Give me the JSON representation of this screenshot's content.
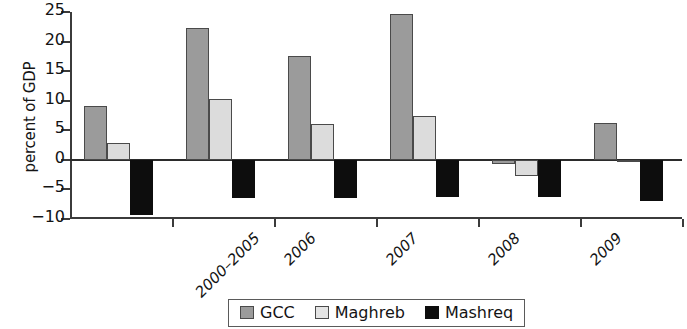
{
  "chart_data": {
    "type": "bar",
    "title": "",
    "xlabel": "",
    "ylabel": "percent of GDP",
    "ylim": [
      -10,
      25
    ],
    "ytick_labels": [
      "25",
      "20",
      "15",
      "10",
      "5",
      "0",
      "-5",
      "-10"
    ],
    "yticks": [
      25,
      20,
      15,
      10,
      5,
      0,
      -5,
      -10
    ],
    "grid": false,
    "legend_position": "bottom-center",
    "categories": [
      "2000–2005",
      "2006",
      "2007",
      "2008",
      "2009",
      "2010"
    ],
    "series": [
      {
        "name": "GCC",
        "color": "#9b9b9b",
        "values": [
          9.1,
          22.3,
          17.6,
          24.7,
          -0.7,
          6.2
        ]
      },
      {
        "name": "Maghreb",
        "color": "#dcdcdc",
        "values": [
          2.8,
          10.3,
          6.1,
          7.5,
          -2.8,
          -0.4
        ]
      },
      {
        "name": "Mashreq",
        "color": "#0d0d0d",
        "values": [
          -9.3,
          -6.5,
          -6.4,
          -6.3,
          -6.3,
          -6.9
        ]
      }
    ]
  },
  "legend": {
    "items": [
      {
        "label": "GCC"
      },
      {
        "label": "Maghreb"
      },
      {
        "label": "Mashreq"
      }
    ]
  }
}
